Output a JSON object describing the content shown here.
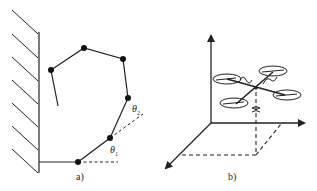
{
  "panel_a": {
    "label": "a)",
    "theta1": "θ",
    "theta1_sub": "1",
    "theta2": "θ",
    "theta2_sub": "2",
    "description": "Planar serial-link manipulator arm mounted on a wall, joint angles θ1 and θ2 marked"
  },
  "panel_b": {
    "label": "b)",
    "description": "Quadrotor drone in 3D coordinate frame with rotation symbols and projection lines"
  },
  "colors": {
    "ink": "#222222",
    "background": "#ffffff"
  }
}
